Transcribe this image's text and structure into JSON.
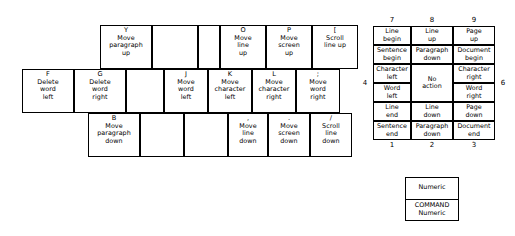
{
  "keyboard": {
    "rows": [
      {
        "name": "top-row",
        "keys": [
          {
            "label": "Y",
            "desc": [
              "Move",
              "paragraph",
              "up"
            ],
            "blank": false
          },
          {
            "label": "",
            "desc": [],
            "blank": true
          },
          {
            "label": "",
            "desc": [],
            "blank": true
          },
          {
            "label": "O",
            "desc": [
              "Move",
              "line",
              "up"
            ],
            "blank": false
          },
          {
            "label": "P",
            "desc": [
              "Move",
              "screen",
              "up"
            ],
            "blank": false
          },
          {
            "label": "[",
            "desc": [
              "Scroll",
              "line up"
            ],
            "blank": false
          }
        ]
      },
      {
        "name": "home-row",
        "keys": [
          {
            "label": "F",
            "desc": [
              "Delete",
              "word",
              "left"
            ],
            "blank": false
          },
          {
            "label": "G",
            "desc": [
              "Delete",
              "word",
              "right"
            ],
            "blank": false
          },
          {
            "label": "",
            "desc": [],
            "blank": true
          },
          {
            "label": "J",
            "desc": [
              "Move",
              "word",
              "left"
            ],
            "blank": false
          },
          {
            "label": "K",
            "desc": [
              "Move",
              "character",
              "left"
            ],
            "blank": false
          },
          {
            "label": "L",
            "desc": [
              "Move",
              "character",
              "right"
            ],
            "blank": false
          },
          {
            "label": ";",
            "desc": [
              "Move",
              "word",
              "right"
            ],
            "blank": false
          }
        ]
      },
      {
        "name": "bottom-row",
        "keys": [
          {
            "label": "B",
            "desc": [
              "Move",
              "paragraph",
              "down"
            ],
            "blank": false
          },
          {
            "label": "",
            "desc": [],
            "blank": true
          },
          {
            "label": "",
            "desc": [],
            "blank": true
          },
          {
            "label": ",",
            "desc": [
              "Move",
              "line",
              "down"
            ],
            "blank": false
          },
          {
            "label": ".",
            "desc": [
              "Move",
              "screen",
              "down"
            ],
            "blank": false
          },
          {
            "label": "/",
            "desc": [
              "Scroll",
              "line",
              "down"
            ],
            "blank": false
          }
        ]
      }
    ]
  },
  "numpad": {
    "top_numbers": [
      "7",
      "8",
      "9"
    ],
    "bottom_numbers": [
      "1",
      "2",
      "3"
    ],
    "left_number": "4",
    "right_number": "6",
    "cells": [
      {
        "key": "7",
        "upper": [
          "Line",
          "begin"
        ],
        "lower": [
          "Sentence",
          "begin"
        ]
      },
      {
        "key": "8",
        "upper": [
          "Line",
          "up"
        ],
        "lower": [
          "Paragraph",
          "down"
        ]
      },
      {
        "key": "9",
        "upper": [
          "Page",
          "up"
        ],
        "lower": [
          "Document",
          "begin"
        ]
      },
      {
        "key": "4",
        "upper": [
          "Character",
          "left"
        ],
        "lower": [
          "Word",
          "left"
        ]
      },
      {
        "key": "5",
        "upper": [
          "No",
          "action"
        ],
        "lower": []
      },
      {
        "key": "6",
        "upper": [
          "Character",
          "right"
        ],
        "lower": [
          "Word",
          "right"
        ]
      },
      {
        "key": "1",
        "upper": [
          "Line",
          "end"
        ],
        "lower": [
          "Sentence",
          "end"
        ]
      },
      {
        "key": "2",
        "upper": [
          "Line",
          "down"
        ],
        "lower": [
          "Paragraph",
          "down"
        ]
      },
      {
        "key": "3",
        "upper": [
          "Page",
          "down"
        ],
        "lower": [
          "Document",
          "end"
        ]
      }
    ]
  },
  "legend": {
    "top": [
      "Numeric"
    ],
    "bottom": [
      "COMMAND",
      "Numeric"
    ]
  }
}
